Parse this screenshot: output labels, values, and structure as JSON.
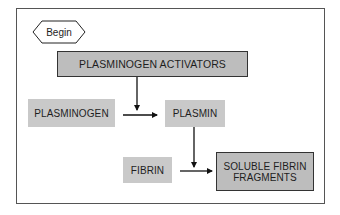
{
  "diagram": {
    "start": {
      "label": "Begin",
      "shape": "diamond"
    },
    "nodes": [
      {
        "id": "plasminogen_activators",
        "label": "PLASMINOGEN ACTIVATORS",
        "style": "dark-bordered"
      },
      {
        "id": "plasminogen",
        "label": "PLASMINOGEN",
        "style": "light"
      },
      {
        "id": "plasmin",
        "label": "PLASMIN",
        "style": "light"
      },
      {
        "id": "fibrin",
        "label": "FIBRIN",
        "style": "light"
      },
      {
        "id": "soluble_fibrin_fragments",
        "label_line1": "SOLUBLE FIBRIN",
        "label_line2": "FRAGMENTS",
        "style": "dark-bordered"
      }
    ],
    "edges": [
      {
        "from": "plasminogen_activators",
        "to": "plasminogen_to_plasmin_arrow",
        "direction": "down"
      },
      {
        "from": "plasminogen",
        "to": "plasmin",
        "direction": "right"
      },
      {
        "from": "plasmin",
        "to": "fibrin_to_fragments_arrow",
        "direction": "down"
      },
      {
        "from": "fibrin",
        "to": "soluble_fibrin_fragments",
        "direction": "right"
      }
    ],
    "colors": {
      "light_box": "#c9c9c9",
      "dark_box": "#bdbdbd",
      "border": "#333333",
      "arrow": "#111111",
      "frame": "#555555"
    }
  }
}
